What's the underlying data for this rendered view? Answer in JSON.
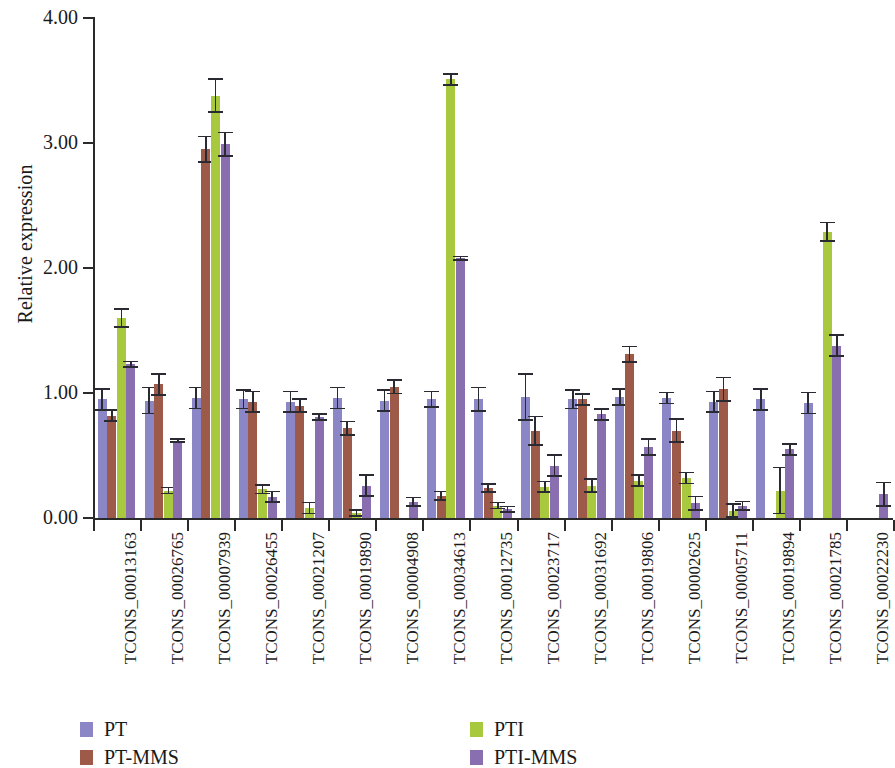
{
  "chart_data": {
    "type": "bar",
    "title": "",
    "xlabel": "",
    "ylabel": "Relative expression",
    "ylim": [
      0,
      4.0
    ],
    "ytick_labels": [
      "0.00",
      "1.00",
      "2.00",
      "3.00",
      "4.00"
    ],
    "ytick_values": [
      0,
      1,
      2,
      3,
      4
    ],
    "grid": false,
    "legend_position": "bottom",
    "orientation": "vertical",
    "error_bars": true,
    "categories": [
      "TCONS_00013163",
      "TCONS_00026765",
      "TCONS_00007939",
      "TCONS_00026455",
      "TCONS_00021207",
      "TCONS_00019890",
      "TCONS_00004908",
      "TCONS_00034613",
      "TCONS_00012735",
      "TCONS_00023717",
      "TCONS_00031692",
      "TCONS_00019806",
      "TCONS_00002625",
      "TCONS_00005711",
      "TCONS_00019894",
      "TCONS_00021785",
      "TCONS_00022230"
    ],
    "series": [
      {
        "name": "PT",
        "color": "#8b87c6",
        "values": [
          0.95,
          0.94,
          0.96,
          0.95,
          0.93,
          0.96,
          0.94,
          0.95,
          0.95,
          0.97,
          0.95,
          0.97,
          0.96,
          0.93,
          0.95,
          0.92,
          0.0
        ],
        "errors": [
          0.09,
          0.11,
          0.09,
          0.08,
          0.09,
          0.09,
          0.09,
          0.07,
          0.1,
          0.19,
          0.08,
          0.07,
          0.05,
          0.09,
          0.09,
          0.09,
          0.0
        ]
      },
      {
        "name": "PT-MMS",
        "color": "#9d5a48",
        "values": [
          0.82,
          1.07,
          2.95,
          0.93,
          0.9,
          0.72,
          1.05,
          0.18,
          0.24,
          0.7,
          0.95,
          1.31,
          0.7,
          1.03,
          0.0,
          0.0,
          0.0
        ],
        "errors": [
          0.05,
          0.09,
          0.11,
          0.09,
          0.06,
          0.06,
          0.06,
          0.04,
          0.04,
          0.12,
          0.05,
          0.07,
          0.1,
          0.1,
          0.0,
          0.0,
          0.0
        ]
      },
      {
        "name": "PTI",
        "color": "#a8c83e",
        "values": [
          1.6,
          0.22,
          3.38,
          0.23,
          0.08,
          0.04,
          0.0,
          3.51,
          0.1,
          0.25,
          0.26,
          0.3,
          0.32,
          0.06,
          0.22,
          2.29,
          0.0
        ],
        "errors": [
          0.08,
          0.03,
          0.14,
          0.04,
          0.05,
          0.03,
          0.0,
          0.05,
          0.03,
          0.05,
          0.06,
          0.05,
          0.05,
          0.06,
          0.19,
          0.08,
          0.0
        ]
      },
      {
        "name": "PTI-MMS",
        "color": "#8a6fb0",
        "values": [
          1.23,
          0.62,
          2.99,
          0.17,
          0.81,
          0.26,
          0.13,
          2.08,
          0.07,
          0.42,
          0.83,
          0.57,
          0.12,
          0.1,
          0.55,
          1.38,
          0.19
        ],
        "errors": [
          0.03,
          0.02,
          0.1,
          0.05,
          0.03,
          0.09,
          0.04,
          0.02,
          0.03,
          0.09,
          0.05,
          0.07,
          0.06,
          0.04,
          0.05,
          0.09,
          0.1
        ]
      }
    ]
  },
  "legend": {
    "entries": [
      {
        "label": "PT",
        "color": "#8b87c6"
      },
      {
        "label": "PTI",
        "color": "#a8c83e"
      },
      {
        "label": "PT-MMS",
        "color": "#9d5a48"
      },
      {
        "label": "PTI-MMS",
        "color": "#8a6fb0"
      }
    ]
  },
  "axes": {
    "y_title": "Relative expression"
  }
}
